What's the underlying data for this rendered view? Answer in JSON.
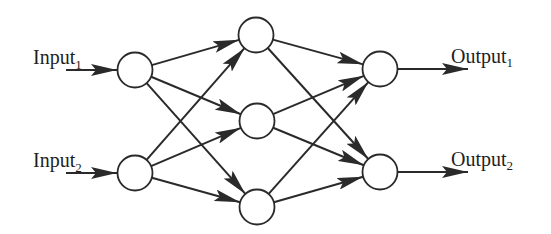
{
  "diagram": {
    "type": "feedforward-neural-network",
    "colors": {
      "stroke": "#2a2a2a",
      "node_fill": "#ffffff",
      "text": "#1e1e1e",
      "background": "#ffffff"
    },
    "layers": [
      {
        "name": "input",
        "nodes": [
          {
            "id": "i1",
            "x": 135,
            "y": 70
          },
          {
            "id": "i2",
            "x": 135,
            "y": 173
          }
        ]
      },
      {
        "name": "hidden",
        "nodes": [
          {
            "id": "h1",
            "x": 256,
            "y": 35
          },
          {
            "id": "h2",
            "x": 257,
            "y": 121
          },
          {
            "id": "h3",
            "x": 257,
            "y": 207
          }
        ]
      },
      {
        "name": "output",
        "nodes": [
          {
            "id": "o1",
            "x": 380,
            "y": 69
          },
          {
            "id": "o2",
            "x": 380,
            "y": 172
          }
        ]
      }
    ],
    "node_radius": 17.5,
    "labels": {
      "input1": {
        "text": "Input",
        "sub": "1"
      },
      "input2": {
        "text": "Input",
        "sub": "2"
      },
      "output1": {
        "text": "Output",
        "sub": "1"
      },
      "output2": {
        "text": "Output",
        "sub": "2"
      }
    },
    "connections": "fully-connected"
  }
}
